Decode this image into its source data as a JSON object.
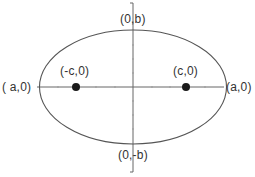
{
  "diagram": {
    "type": "ellipse-foci",
    "colors": {
      "stroke": "#555555",
      "axis": "#666666",
      "focus": "#1a1a1a",
      "text": "#333333",
      "background": "#ffffff"
    },
    "ellipse": {
      "cx": 133,
      "cy": 87,
      "rx": 93.5,
      "ry": 57
    },
    "axes": {
      "horizontal": {
        "x1": 37,
        "x2": 224,
        "y": 87
      },
      "vertical": {
        "x": 133,
        "y1": 3,
        "y2": 172
      }
    },
    "foci": [
      {
        "x": 76,
        "y": 87,
        "r": 4
      },
      {
        "x": 186,
        "y": 87,
        "r": 4
      }
    ],
    "labels": {
      "left_vertex": "( a,0)",
      "right_vertex": "(a,0)",
      "top_vertex": "(0,b)",
      "bottom_vertex": "(0,-b)",
      "left_focus": "(-c,0)",
      "right_focus": "(c,0)"
    }
  }
}
